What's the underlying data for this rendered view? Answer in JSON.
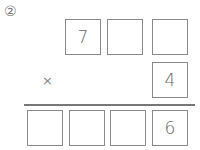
{
  "problem_number": "②",
  "operator": "×",
  "multiplicand": [
    "7",
    "",
    ""
  ],
  "multiplier": [
    "4"
  ],
  "product": [
    "",
    "",
    "",
    "6"
  ]
}
